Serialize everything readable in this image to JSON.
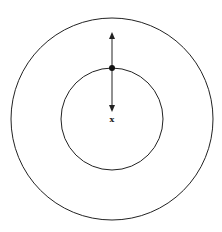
{
  "diagram": {
    "type": "concentric-circles-with-vectors",
    "stroke_color": "#222222",
    "background": "#ffffff",
    "outer_circle": {
      "cx": 112,
      "cy": 119,
      "r": 101
    },
    "inner_circle": {
      "cx": 112,
      "cy": 119,
      "r": 51
    },
    "point": {
      "cx": 112,
      "cy": 68,
      "r": 3
    },
    "arrow_up": {
      "x1": 112,
      "y1": 68,
      "x2": 112,
      "y2": 32
    },
    "arrow_down": {
      "x1": 112,
      "y1": 68,
      "x2": 112,
      "y2": 112
    },
    "center_label": {
      "text": "x",
      "x": 112,
      "y": 122
    }
  }
}
